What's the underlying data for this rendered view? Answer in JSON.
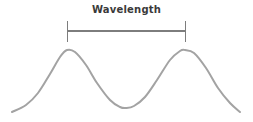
{
  "figure": {
    "background_color": "#ffffff",
    "width": 253,
    "height": 122,
    "label": "Wavelength",
    "label_color": "#3a3a3a"
  },
  "measurement": {
    "name": "wavelength-span",
    "bar_color": "#7d7d7d",
    "bar_y": 31,
    "left_tick_x": 67,
    "right_tick_x": 185,
    "tick_top": 21,
    "tick_bottom": 42,
    "span_px": 118
  },
  "chart_data": {
    "type": "line",
    "title": "Wavelength",
    "xlabel": "",
    "ylabel": "",
    "grid": false,
    "legend": "none",
    "series": [
      {
        "name": "wave",
        "color": "#a3a3a3",
        "stroke_width": 2,
        "description": "cosine wave, two crests with one trough between",
        "period_px": 118,
        "amplitude_px": 29,
        "baseline_y": 79,
        "crest_y": 50,
        "trough_y": 108,
        "x_start": 12,
        "x_end": 240,
        "crests_x": [
          67,
          185
        ],
        "troughs_x": [
          126
        ],
        "points": [
          {
            "x": 12,
            "y": 112
          },
          {
            "x": 26,
            "y": 105
          },
          {
            "x": 38,
            "y": 93
          },
          {
            "x": 50,
            "y": 74
          },
          {
            "x": 60,
            "y": 57
          },
          {
            "x": 67,
            "y": 50
          },
          {
            "x": 75,
            "y": 52
          },
          {
            "x": 86,
            "y": 65
          },
          {
            "x": 97,
            "y": 83
          },
          {
            "x": 110,
            "y": 100
          },
          {
            "x": 120,
            "y": 107
          },
          {
            "x": 126,
            "y": 108
          },
          {
            "x": 134,
            "y": 106
          },
          {
            "x": 145,
            "y": 97
          },
          {
            "x": 157,
            "y": 80
          },
          {
            "x": 170,
            "y": 60
          },
          {
            "x": 180,
            "y": 51
          },
          {
            "x": 185,
            "y": 50
          },
          {
            "x": 194,
            "y": 53
          },
          {
            "x": 206,
            "y": 68
          },
          {
            "x": 218,
            "y": 88
          },
          {
            "x": 230,
            "y": 103
          },
          {
            "x": 240,
            "y": 112
          }
        ]
      }
    ]
  }
}
